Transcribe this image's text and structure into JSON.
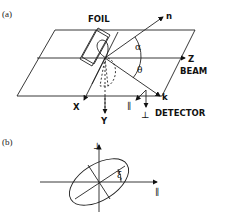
{
  "panel_a": {
    "label": "(a)",
    "foil": "FOIL",
    "n": "n",
    "alpha": "α",
    "theta": "θ",
    "z": "Z",
    "beam": "BEAM",
    "k": "k",
    "x": "X",
    "y": "Y",
    "parallel": "∥",
    "perp": "⊥",
    "detector": "DETECTOR"
  },
  "panel_b": {
    "label": "(b)",
    "perp": "⊥",
    "parallel": "∥",
    "xi": "ξ"
  }
}
